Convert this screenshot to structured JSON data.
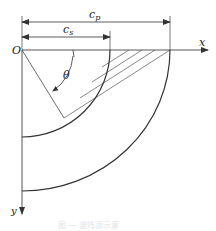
{
  "diagram": {
    "labels": {
      "origin": "O",
      "x_axis": "x",
      "y_axis": "y",
      "angle": "θ",
      "cp_main": "c",
      "cp_sub": "p",
      "cs_main": "c",
      "cs_sub": "s"
    },
    "caption": "图 — 波阵面示意",
    "colors": {
      "line": "#333333",
      "thin_line": "#555555",
      "caption": "#e4e4e4"
    }
  }
}
